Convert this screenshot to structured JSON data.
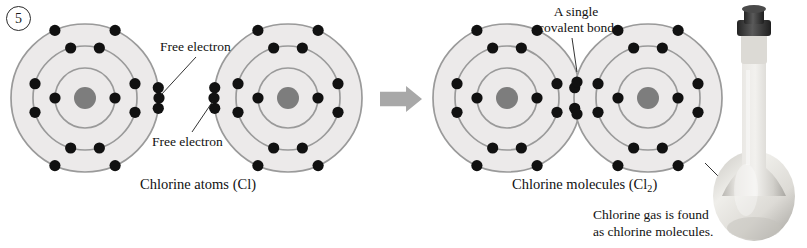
{
  "figure": {
    "number": "5",
    "background": "#ffffff"
  },
  "palette": {
    "shell_fill": "#eceaea",
    "shell_stroke": "#9a9a9a",
    "nucleus": "#7d7d7d",
    "electron": "#111111",
    "arrow": "#a8a8a8",
    "leader": "#1c1c1c",
    "text": "#111111",
    "flask_glass": "#cfcdc8",
    "flask_stopper": "#3a3a3a"
  },
  "labels": {
    "free_electron_top": "Free electron",
    "free_electron_bottom": "Free electron",
    "covalent_bond_line1": "A single",
    "covalent_bond_line2": "covalent bond",
    "caption_atoms": "Chlorine atoms (Cl)",
    "caption_molecules_main": "Chlorine molecules (Cl",
    "caption_molecules_sub": "2",
    "caption_molecules_close": ")",
    "flask_note_line1": "Chlorine gas is found",
    "flask_note_line2": "as chlorine molecules."
  },
  "atom_model": {
    "element": "Cl",
    "shell_radii": [
      30,
      52,
      74
    ],
    "shell_electron_counts": [
      2,
      8,
      7
    ],
    "nucleus_radius": 11,
    "electron_radius": 5.6
  },
  "atoms": [
    {
      "name": "chlorine-atom-left",
      "cx": 85,
      "cy": 98,
      "free_electron_side": "right"
    },
    {
      "name": "chlorine-atom-right",
      "cx": 288,
      "cy": 98,
      "free_electron_side": "left"
    }
  ],
  "molecule": {
    "name": "chlorine-molecule",
    "left_cx": 507,
    "right_cx": 648,
    "cy": 98,
    "bond_electron_pairs": 1,
    "shared_pair_x": 577
  },
  "arrow": {
    "x": 380,
    "y": 86,
    "width": 42,
    "height": 26,
    "direction": "right"
  },
  "leaders": [
    {
      "name": "leader-free-electron-top",
      "x1": 196,
      "y1": 57,
      "x2": 161,
      "y2": 95
    },
    {
      "name": "leader-free-electron-bottom",
      "x1": 192,
      "y1": 132,
      "x2": 213,
      "y2": 101
    },
    {
      "name": "leader-covalent-bond",
      "x1": 572,
      "y1": 38,
      "x2": 577,
      "y2": 72
    },
    {
      "name": "leader-flask-note",
      "x1": 705,
      "y1": 163,
      "x2": 757,
      "y2": 215
    }
  ]
}
